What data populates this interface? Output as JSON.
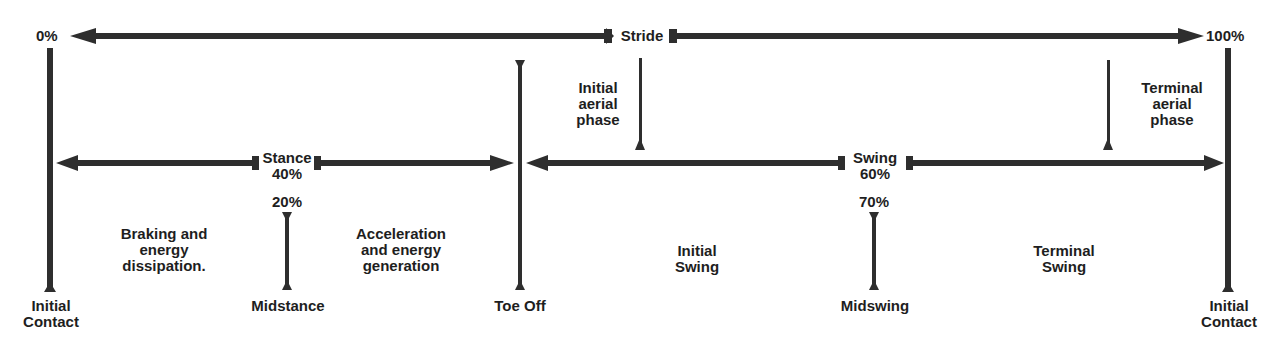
{
  "diagram": {
    "type": "gait-cycle-timeline",
    "colors": {
      "line": "#2e2e2e",
      "text": "#1e1e1e",
      "background": "#ffffff"
    },
    "stride": {
      "label": "Stride",
      "start_label": "0%",
      "end_label": "100%"
    },
    "phases": {
      "stance": {
        "label": "Stance\n40%"
      },
      "swing": {
        "label": "Swing\n60%"
      }
    },
    "events": {
      "initial_contact_start": "Initial\nContact",
      "midstance": "Midstance",
      "midstance_pct": "20%",
      "toe_off": "Toe Off",
      "midswing": "Midswing",
      "midswing_pct": "70%",
      "initial_contact_end": "Initial\nContact"
    },
    "descriptions": {
      "braking": "Braking and\nenergy\ndissipation.",
      "acceleration": "Acceleration\nand energy\ngeneration",
      "initial_aerial": "Initial\naerial\nphase",
      "terminal_aerial": "Terminal\naerial\nphase",
      "initial_swing": "Initial\nSwing",
      "terminal_swing": "Terminal\nSwing"
    }
  }
}
